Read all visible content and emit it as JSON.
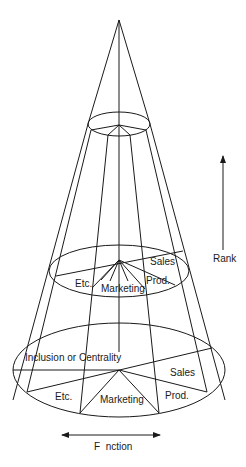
{
  "diagram": {
    "type": "cone-organization-model",
    "colors": {
      "line": "#1a1a1a",
      "background": "#ffffff"
    },
    "axes": {
      "vertical": {
        "label": "Rank",
        "direction": "up"
      },
      "horizontal": {
        "label": "F  nction",
        "direction": "both"
      }
    },
    "middle_section": {
      "labels": {
        "sales": "Sales",
        "prod": "Prod.",
        "marketing": "Marketing",
        "etc": "Etc."
      }
    },
    "base_section": {
      "labels": {
        "inclusion": "Inclusion or Centrality",
        "sales": "Sales",
        "prod": "Prod.",
        "marketing": "Marketing",
        "etc": "Etc."
      }
    }
  }
}
